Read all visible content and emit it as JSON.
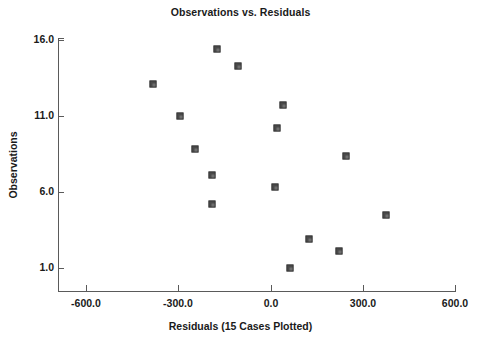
{
  "chart_data": {
    "type": "scatter",
    "title": "Observations vs. Residuals",
    "xlabel": "Residuals (15 Cases Plotted)",
    "ylabel": "Observations",
    "xlim": [
      -750,
      660
    ],
    "ylim": [
      0.1,
      16.8
    ],
    "xticks": [
      -600,
      -300,
      0,
      300,
      600
    ],
    "xtick_labels": [
      "-600.0",
      "-300.0",
      "0.0",
      "300.0",
      "600.0"
    ],
    "yticks": [
      16,
      11,
      6,
      1
    ],
    "ytick_labels": [
      "16.0",
      "11.0",
      "6.0",
      "1.0"
    ],
    "grid": false,
    "legend": null,
    "n_cases": 15,
    "marker": "filled-square",
    "marker_color": "#4a4a4a",
    "axis_color": "#5a5a5a",
    "text_color": "#1a1a1a",
    "background_color": "#ffffff",
    "points": [
      {
        "x": -175,
        "y": 15.4
      },
      {
        "x": -107,
        "y": 14.3
      },
      {
        "x": -383,
        "y": 13.1
      },
      {
        "x": -295,
        "y": 11.0
      },
      {
        "x": 39,
        "y": 11.7
      },
      {
        "x": 20,
        "y": 10.2
      },
      {
        "x": -247,
        "y": 8.8
      },
      {
        "x": 244,
        "y": 8.4
      },
      {
        "x": -192,
        "y": 7.1
      },
      {
        "x": 16,
        "y": 6.3
      },
      {
        "x": -192,
        "y": 5.2
      },
      {
        "x": 374,
        "y": 4.5
      },
      {
        "x": 124,
        "y": 2.9
      },
      {
        "x": 221,
        "y": 2.1
      },
      {
        "x": 62,
        "y": 1.0
      }
    ]
  }
}
